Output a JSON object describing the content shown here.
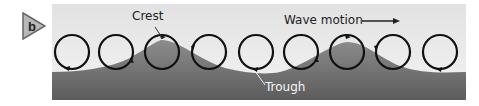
{
  "panel_label": "b",
  "labels": {
    "crest": "Crest",
    "trough": "Trough",
    "wave_motion": "Wave motion"
  },
  "colors": {
    "badge_fill": "#b8b8b8",
    "sky_top": "#e4e4e4",
    "sky_bottom": "#f2f2f2",
    "water_top": "#8a8a8a",
    "water_bottom": "#5e5e5e",
    "circle_stroke": "#111111"
  },
  "circles": {
    "count": 9,
    "centers_x": [
      72,
      116,
      162,
      209,
      256,
      301,
      347,
      393,
      440
    ],
    "center_y": 52,
    "radius": 17
  }
}
